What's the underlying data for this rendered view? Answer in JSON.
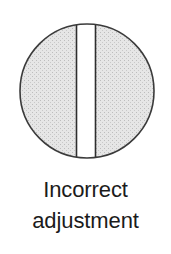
{
  "figure": {
    "kind": "technical-illustration",
    "caption": {
      "line1": "Incorrect",
      "line2": "adjustment"
    },
    "colors": {
      "background": "#ffffff",
      "circle_fill": "#dedede",
      "circle_stroke": "#3b3b3b",
      "band_fill": "#ffffff",
      "band_edge_stroke": "#2e2e2e",
      "caption_text": "#1b1b1b"
    },
    "geometry": {
      "circle_center_x": 87,
      "circle_center_y": 91,
      "circle_radius": 67,
      "band_left_x": 76,
      "band_right_x": 96,
      "band_width": 20
    },
    "parts": [
      {
        "name": "circle-outline",
        "label": "circle outline"
      },
      {
        "name": "stippled-fill",
        "label": "stippled gray fill"
      },
      {
        "name": "vertical-band",
        "label": "vertical white band"
      },
      {
        "name": "band-left-edge",
        "label": "left band edge line"
      },
      {
        "name": "band-right-edge",
        "label": "right band edge line"
      }
    ]
  }
}
